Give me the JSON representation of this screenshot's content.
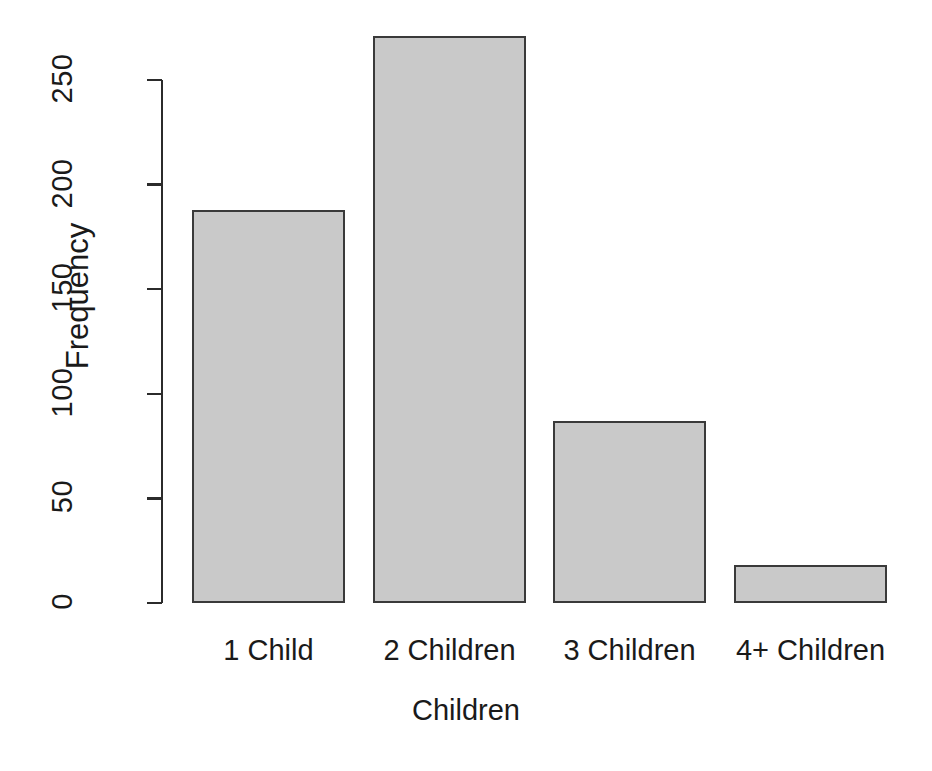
{
  "chart_data": {
    "type": "bar",
    "title": "",
    "subtitle": "",
    "xlabel": "Children",
    "ylabel": "Frequency",
    "categories": [
      "1 Child",
      "2 Children",
      "3 Children",
      "4+ Children"
    ],
    "values": [
      188,
      271,
      87,
      18
    ],
    "ylim": [
      0,
      271
    ],
    "yticks": [
      0,
      50,
      100,
      150,
      200,
      250
    ],
    "ytick_labels": [
      "0",
      "50",
      "100",
      "150",
      "200",
      "250"
    ],
    "xticks_shown": false,
    "grid": false,
    "legend": null,
    "legend_position": "none",
    "annotations": [],
    "bar_fill_color": "#c9c9c9",
    "bar_border_color": "#3a3a3a",
    "background_color": "#ffffff",
    "text_color": "#1a1a1a",
    "axis_color": "#2b2b2b",
    "ytick_label_rotation": -90,
    "ylabel_rotation": -90
  }
}
